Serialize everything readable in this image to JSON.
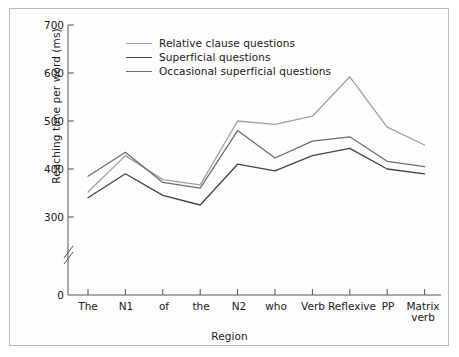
{
  "figure": {
    "y_axis_title": "Reaching time per word (ms)",
    "x_axis_title": "Region"
  },
  "legend": {
    "items": [
      {
        "label": "Relative clause questions",
        "color": "#a0a0a0"
      },
      {
        "label": "Superficial questions",
        "color": "#444444"
      },
      {
        "label": "Occasional superficial questions",
        "color": "#6e6e6e"
      }
    ]
  },
  "axes": {
    "y_ticks": [
      "0",
      "300",
      "400",
      "500",
      "600",
      "700"
    ],
    "x_ticks": [
      "The",
      "N1",
      "of",
      "the",
      "N2",
      "who",
      "Verb",
      "Reflexive",
      "PP",
      "Matrix verb"
    ],
    "y_break": true
  },
  "chart_data": {
    "type": "line",
    "title": "",
    "subtitle": "",
    "xlabel": "Region",
    "ylabel": "Reaching time per word (ms)",
    "categories": [
      "The",
      "N1",
      "of",
      "the",
      "N2",
      "who",
      "Verb",
      "Reflexive",
      "PP",
      "Matrix verb"
    ],
    "series": [
      {
        "name": "Relative clause questions",
        "color": "#a0a0a0",
        "values": [
          352,
          428,
          378,
          367,
          500,
          493,
          510,
          592,
          487,
          450
        ]
      },
      {
        "name": "Superficial questions",
        "color": "#444444",
        "values": [
          340,
          390,
          345,
          325,
          410,
          396,
          428,
          443,
          400,
          390
        ]
      },
      {
        "name": "Occasional superficial questions",
        "color": "#6e6e6e",
        "values": [
          385,
          435,
          372,
          360,
          480,
          423,
          458,
          467,
          416,
          405
        ]
      }
    ],
    "ylim": [
      300,
      700
    ],
    "ytick_values": [
      300,
      400,
      500,
      600,
      700
    ],
    "y_axis_break_below": 300,
    "grid": false,
    "legend_position": "inside-top-left"
  }
}
